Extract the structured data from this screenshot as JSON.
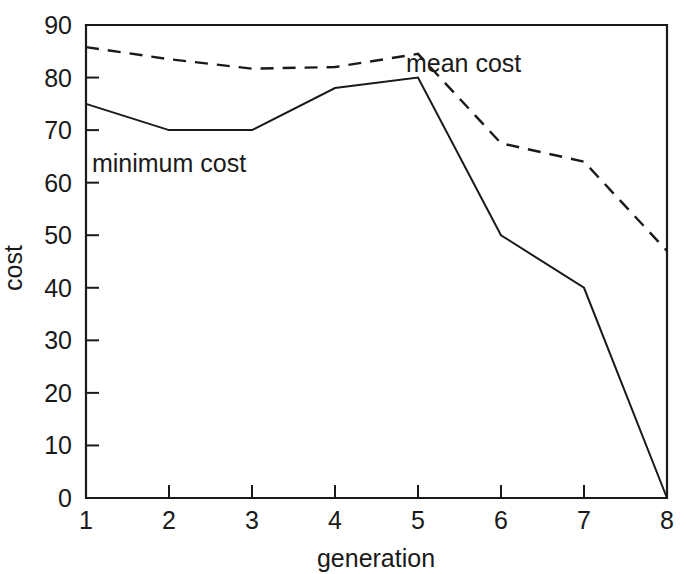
{
  "chart_data": {
    "type": "line",
    "title": "",
    "xlabel": "generation",
    "ylabel": "cost",
    "x": [
      1,
      2,
      3,
      4,
      5,
      6,
      7,
      8
    ],
    "xlim": [
      1,
      8
    ],
    "ylim": [
      0,
      90
    ],
    "x_ticks": [
      "1",
      "2",
      "3",
      "4",
      "5",
      "6",
      "7",
      "8"
    ],
    "y_ticks": [
      "0",
      "10",
      "20",
      "30",
      "40",
      "50",
      "60",
      "70",
      "80",
      "90"
    ],
    "grid": false,
    "legend_position": "inline-annotations",
    "series": [
      {
        "name": "minimum cost",
        "style": "solid",
        "color": "#1a1a1a",
        "values": [
          75,
          70,
          70,
          78,
          80,
          50,
          40,
          0
        ]
      },
      {
        "name": "mean cost",
        "style": "dashed",
        "color": "#1a1a1a",
        "values": [
          85.8,
          83.5,
          81.7,
          82,
          84.5,
          67.5,
          64,
          47
        ]
      }
    ],
    "annotations": [
      {
        "text": "minimum cost",
        "x": 2.0,
        "y": 62
      },
      {
        "text": "mean cost",
        "x": 5.55,
        "y": 81
      }
    ]
  }
}
